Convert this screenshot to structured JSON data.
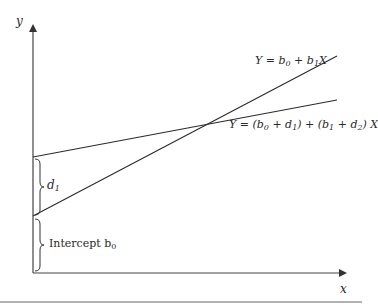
{
  "diagram": {
    "axes": {
      "y_label": "y",
      "x_label": "x",
      "color": "#333333"
    },
    "lines": [
      {
        "name": "base-regression-line",
        "equation": "Y = b0 + b1X",
        "label_parts": {
          "pre": "Y = b",
          "s0": "0",
          "mid": " + b",
          "s1": "1",
          "post": "X"
        },
        "from": [
          33,
          216
        ],
        "to": [
          337,
          56
        ]
      },
      {
        "name": "dummy-interaction-line",
        "equation": "Y = (b0 + d1) + (b1 + d2) X",
        "label_parts": {
          "a": "Y = (b",
          "s0": "0",
          "b": " + d",
          "s1": "1",
          "c": ") + (b",
          "s2": "1",
          "d": " + d",
          "s3": "2",
          "e": ") X"
        },
        "from": [
          33,
          157
        ],
        "to": [
          337,
          100
        ]
      }
    ],
    "annotations": {
      "d1": {
        "text": "d",
        "sub": "1"
      },
      "intercept": {
        "text": "Intercept b",
        "sub": "0"
      }
    },
    "line_color": "#2a2a2a",
    "separator_color": "#555555"
  }
}
